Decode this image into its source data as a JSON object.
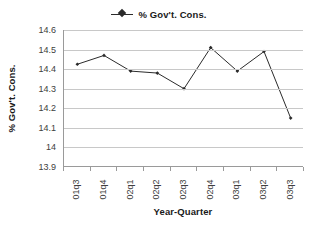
{
  "chart_data": {
    "type": "line",
    "title": "",
    "xlabel": "Year-Quarter",
    "ylabel": "% Gov't. Cons.",
    "categories": [
      "01q3",
      "01q4",
      "02q1",
      "02q2",
      "02q3",
      "02q4",
      "03q1",
      "03q2",
      "03q3"
    ],
    "series": [
      {
        "name": "% Gov't. Cons.",
        "values": [
          14.425,
          14.47,
          14.39,
          14.38,
          14.3,
          14.51,
          14.39,
          14.49,
          14.15
        ]
      }
    ],
    "ylim": [
      13.9,
      14.6
    ],
    "ytick_step": 0.1,
    "ytick_labels": [
      "14.6",
      "14.5",
      "14.4",
      "14.3",
      "14.2",
      "14.1",
      "14",
      "13.9"
    ],
    "ytick_values": [
      14.6,
      14.5,
      14.4,
      14.3,
      14.2,
      14.1,
      14.0,
      13.9
    ],
    "grid": "horizontal",
    "legend_position": "top-center",
    "marker": "diamond",
    "series_color": "#2b2b2b",
    "gridline_color": "#c8c8c8",
    "axis_color": "#9a9a9a",
    "background_color": "#ffffff"
  },
  "legend": {
    "entries": [
      {
        "label": "% Gov't. Cons.",
        "symbol": "line-with-diamond-marker"
      }
    ]
  },
  "axes": {
    "y_title": "% Gov't. Cons.",
    "x_title": "Year-Quarter"
  }
}
